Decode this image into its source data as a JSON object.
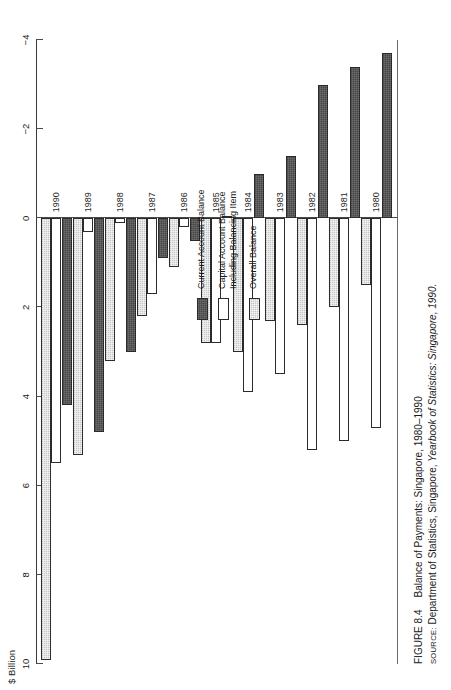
{
  "figure": {
    "axis_title": "$ Billion",
    "caption_number": "FIGURE 8.4",
    "caption_title": "Balance of Payments: Singapore, 1980–1990",
    "source_label": "SOURCE:",
    "source_text_plain": "Department of Statistics, Singapore, ",
    "source_text_italic": "Yearbook of Statistics: Singapore, 1990."
  },
  "legend": {
    "position": "inside-right",
    "entries": [
      {
        "label": "Current Account Balance",
        "series": "current",
        "color": "#474747"
      },
      {
        "label": "Capital Account Balance\nIncluding Balancing Item",
        "series": "capital",
        "color": "#ffffff"
      },
      {
        "label": "Overall Balance",
        "series": "overall",
        "color": "#c6c6c6"
      }
    ]
  },
  "axis": {
    "tick_labels": [
      "10",
      "8",
      "6",
      "4",
      "2",
      "0",
      "−2",
      "−4"
    ],
    "tick_values": [
      10,
      8,
      6,
      4,
      2,
      0,
      -2,
      -4
    ],
    "min": -4,
    "max": 10
  },
  "chart_data": {
    "type": "bar",
    "orientation": "horizontal-rotated",
    "title": "Balance of Payments: Singapore, 1980–1990",
    "xlabel": "",
    "ylabel": "$ Billion",
    "ylim": [
      -4,
      10
    ],
    "grid": false,
    "legend_position": "inside-right",
    "categories": [
      "1980",
      "1981",
      "1982",
      "1983",
      "1984",
      "1985",
      "1986",
      "1987",
      "1988",
      "1989",
      "1990"
    ],
    "series": [
      {
        "name": "Current Account Balance",
        "color": "#474747",
        "values": [
          -3.7,
          -3.4,
          -3.0,
          -1.4,
          -1.0,
          0.0,
          0.5,
          0.9,
          3.0,
          4.8,
          4.2
        ]
      },
      {
        "name": "Capital Account Balance Including Balancing Item",
        "color": "#ffffff",
        "values": [
          4.7,
          5.0,
          5.2,
          3.5,
          3.9,
          2.8,
          0.2,
          1.7,
          0.1,
          0.3,
          5.5
        ]
      },
      {
        "name": "Overall Balance",
        "color": "#c6c6c6",
        "values": [
          1.5,
          2.0,
          2.4,
          2.3,
          3.0,
          2.8,
          1.1,
          2.2,
          3.2,
          5.3,
          9.9
        ]
      }
    ]
  }
}
